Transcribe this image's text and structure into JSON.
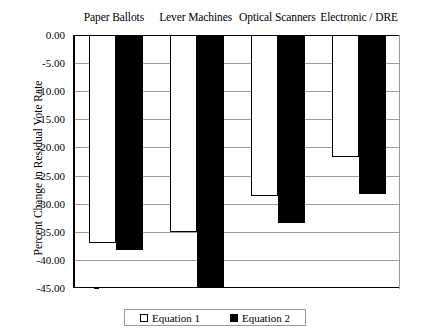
{
  "chart_data": {
    "type": "bar",
    "title": "",
    "subtitle": "",
    "xlabel": "",
    "ylabel": "Percent Change in Residual Vote Rate",
    "categories": [
      "Paper Ballots",
      "Lever Machines",
      "Optical Scanners",
      "Electronic / DRE"
    ],
    "series": [
      {
        "name": "Equation 1",
        "color": "#ffffff",
        "values": [
          -37.0,
          -35.0,
          -28.7,
          -21.7
        ]
      },
      {
        "name": "Equation 2",
        "color": "#000000",
        "values": [
          -38.3,
          -44.9,
          -33.5,
          -28.2
        ]
      }
    ],
    "ylim": [
      -45.0,
      0.0
    ],
    "ytick_values": [
      0.0,
      -5.0,
      -10.0,
      -15.0,
      -20.0,
      -25.0,
      -30.0,
      -35.0,
      -40.0,
      -45.0
    ],
    "ytick_labels": [
      "0.00",
      "-5.00",
      "-10.00",
      "-15.00",
      "-20.00",
      "-25.00",
      "-30.00",
      "-35.00",
      "-40.00",
      "-45.00"
    ],
    "grid": true,
    "grid_axis": "y",
    "legend_position": "bottom",
    "category_label_position": "top"
  },
  "legend": {
    "items": [
      {
        "label": "Equation 1",
        "swatch": "open-square"
      },
      {
        "label": "Equation 2",
        "swatch": "solid-square"
      }
    ]
  }
}
